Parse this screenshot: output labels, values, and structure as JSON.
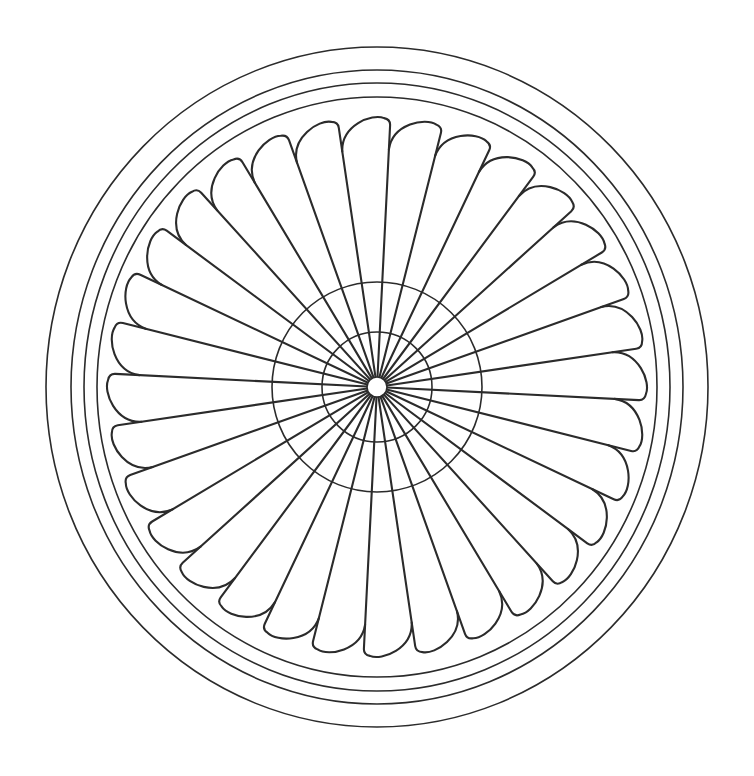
{
  "drawing": {
    "title": "Circular radial blade line-art pattern",
    "style": "black outline coloring page",
    "stroke_color": "#2b2b2b",
    "background_color": "#ffffff",
    "center": [
      377,
      387
    ],
    "outer_rings": [
      {
        "rx": 331,
        "ry": 340
      },
      {
        "rx": 306,
        "ry": 317
      },
      {
        "rx": 293,
        "ry": 304
      },
      {
        "rx": 280,
        "ry": 290
      }
    ],
    "inner_circles": [
      {
        "r": 105
      },
      {
        "r": 55
      },
      {
        "r": 10
      }
    ],
    "blades": {
      "count": 32,
      "tip_radius": 268,
      "trailing_radius": 238,
      "hub_radius": 10
    }
  }
}
